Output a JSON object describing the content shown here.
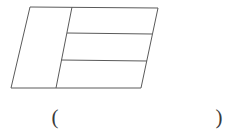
{
  "page": {
    "background_color": "#ffffff",
    "width": 241,
    "height": 136
  },
  "figure": {
    "name": "divided-parallelogram",
    "stroke_color": "#5a5a5a",
    "fill_color": "none",
    "stroke_width": 1,
    "vertices": {
      "top_left": [
        30,
        7
      ],
      "top_right": [
        158,
        8
      ],
      "bottom_right": [
        141,
        88
      ],
      "bottom_left": [
        11,
        88
      ]
    },
    "slanted_divider": {
      "name": "slanted-divider-line",
      "from": [
        72,
        7
      ],
      "to": [
        56,
        88
      ]
    },
    "horizontal_dividers": [
      {
        "name": "horizontal-divider-upper",
        "from": [
          67,
          33
        ],
        "to": [
          152,
          34
        ]
      },
      {
        "name": "horizontal-divider-lower",
        "from": [
          61,
          60
        ],
        "to": [
          147,
          61
        ]
      }
    ]
  },
  "answer": {
    "left_paren": "(",
    "right_paren": ")",
    "blank_value": ""
  }
}
